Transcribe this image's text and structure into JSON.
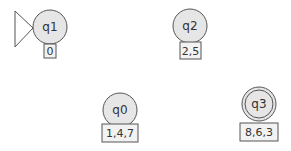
{
  "diagram": {
    "type": "state-machine",
    "colors": {
      "state_fill": "#e6e6e6",
      "stroke": "#555555",
      "box_fill": "#f2f2f2",
      "text": "#333333"
    },
    "states": [
      {
        "id": "q1",
        "label": "q1",
        "set": "0",
        "initial": true,
        "accepting": false
      },
      {
        "id": "q2",
        "label": "q2",
        "set": "2,5",
        "initial": false,
        "accepting": false
      },
      {
        "id": "q0",
        "label": "q0",
        "set": "1,4,7",
        "initial": false,
        "accepting": false
      },
      {
        "id": "q3",
        "label": "q3",
        "set": "8,6,3",
        "initial": false,
        "accepting": true
      }
    ]
  }
}
